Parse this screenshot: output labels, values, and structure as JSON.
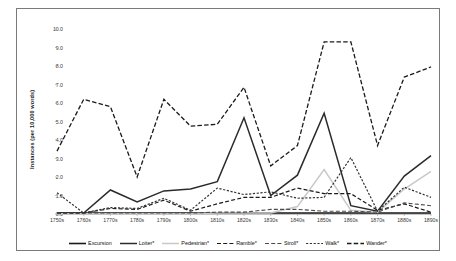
{
  "chart_data": {
    "type": "line",
    "title": "",
    "xlabel": "",
    "ylabel": "Instances (per 10,000 words)",
    "ylim": [
      0.0,
      10.0
    ],
    "yticks": [
      "0.0",
      "1.0",
      "2.0",
      "3.0",
      "4.0",
      "5.0",
      "6.0",
      "7.0",
      "8.0",
      "9.0",
      "10.0"
    ],
    "grid": false,
    "legend_position": "bottom",
    "categories": [
      "1750s",
      "1760s",
      "1770s",
      "1780s",
      "1790s",
      "1800s",
      "1810s",
      "1820s",
      "1830s",
      "1840s",
      "1850s",
      "1860s",
      "1870s",
      "1880s",
      "1890s"
    ],
    "series": [
      {
        "name": "Excursion",
        "style": "solid",
        "color": "#1a1a1a",
        "width": 1.6,
        "values": [
          0.05,
          0.05,
          0.05,
          0.05,
          0.05,
          0.05,
          0.05,
          0.05,
          0.05,
          0.05,
          0.05,
          0.05,
          0.05,
          0.05,
          0.05
        ]
      },
      {
        "name": "Loiter*",
        "style": "solid",
        "color": "#2b2b2b",
        "width": 1.5,
        "values": [
          0.05,
          0.05,
          1.3,
          0.65,
          1.25,
          1.35,
          1.75,
          5.2,
          1.0,
          2.1,
          5.45,
          0.45,
          0.15,
          2.05,
          3.15
        ]
      },
      {
        "name": "Pedestrian*",
        "style": "solid",
        "color": "#c8c8c8",
        "width": 1.5,
        "values": [
          0.02,
          0.02,
          0.02,
          0.02,
          0.02,
          0.02,
          0.05,
          0.05,
          0.05,
          0.4,
          2.4,
          0.2,
          0.1,
          1.35,
          2.3
        ]
      },
      {
        "name": "Ramble*",
        "style": "dashed",
        "color": "#1a1a1a",
        "width": 1.2,
        "values": [
          0.05,
          0.05,
          0.3,
          0.25,
          0.75,
          0.15,
          0.55,
          0.9,
          0.9,
          1.4,
          1.1,
          1.1,
          0.2,
          0.55,
          0.1
        ]
      },
      {
        "name": "Stroll*",
        "style": "dashed",
        "color": "#4a4a4a",
        "width": 1.1,
        "values": [
          0.05,
          0.05,
          0.05,
          0.05,
          0.05,
          0.05,
          0.1,
          0.1,
          0.25,
          0.25,
          0.15,
          0.15,
          0.1,
          0.6,
          0.45
        ]
      },
      {
        "name": "Walk*",
        "style": "dotted",
        "color": "#333333",
        "width": 1.2,
        "values": [
          1.15,
          0.05,
          0.35,
          0.3,
          0.85,
          0.2,
          1.4,
          1.05,
          1.2,
          0.85,
          0.9,
          3.05,
          0.15,
          1.45,
          0.9
        ]
      },
      {
        "name": "Wander*",
        "style": "dashed-long",
        "color": "#1a1a1a",
        "width": 1.3,
        "values": [
          3.4,
          6.2,
          5.8,
          2.0,
          6.2,
          4.75,
          4.85,
          6.85,
          2.6,
          3.7,
          9.3,
          9.3,
          3.7,
          7.4,
          7.95
        ]
      }
    ]
  },
  "axis": {
    "y_title": "Instances (per 10,000 words)"
  },
  "legend": {
    "items": [
      {
        "label": "Excursion"
      },
      {
        "label": "Loiter*"
      },
      {
        "label": "Pedestrian*"
      },
      {
        "label": "Ramble*"
      },
      {
        "label": "Stroll*"
      },
      {
        "label": "Walk*"
      },
      {
        "label": "Wander*"
      }
    ]
  }
}
